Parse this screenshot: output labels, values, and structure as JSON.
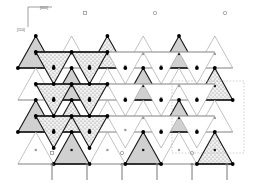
{
  "figure": {
    "name": "tetrahedral-framework-projection",
    "background": "#ffffff"
  },
  "axes": {
    "origin": [
      28,
      27
    ],
    "horizontal": {
      "label": "[001]",
      "length": 24,
      "label_pos": [
        40,
        9
      ]
    },
    "vertical": {
      "label": "[110]",
      "length": 20,
      "label_pos": [
        17,
        31
      ]
    },
    "color": "#777777"
  },
  "colors": {
    "edge_dark": "#1a1a1a",
    "edge_light": "#999999",
    "fill_gray": "#d0d0d0",
    "fill_stipple": "#e8e8e8",
    "fill_white": "#ffffff",
    "vertex": "#000000",
    "marker": "#9a9a9a",
    "arrow": "#777777",
    "cell_box": "#bbbbbb"
  },
  "lattice": {
    "x_start": 18,
    "x_step": 35.8,
    "columns": 7,
    "y_rows": [
      36,
      68,
      100,
      132
    ],
    "tri_half_width": 17.9,
    "tri_height": 32,
    "note": "alternating up/down triangles forming a corner-sharing tetrahedral net"
  },
  "triangles": [
    {
      "cx": 35.8,
      "cy": 52,
      "dir": "up",
      "fill": "gray",
      "edge": "dark"
    },
    {
      "cx": 71.6,
      "cy": 52,
      "dir": "up",
      "fill": "white",
      "edge": "light"
    },
    {
      "cx": 107.4,
      "cy": 52,
      "dir": "up",
      "fill": "stipple",
      "edge": "dark"
    },
    {
      "cx": 143.2,
      "cy": 52,
      "dir": "up",
      "fill": "white",
      "edge": "light"
    },
    {
      "cx": 179.0,
      "cy": 52,
      "dir": "up",
      "fill": "gray",
      "edge": "dark"
    },
    {
      "cx": 214.8,
      "cy": 52,
      "dir": "up",
      "fill": "white",
      "edge": "light"
    },
    {
      "cx": 53.7,
      "cy": 68,
      "dir": "down",
      "fill": "stipple",
      "edge": "dark"
    },
    {
      "cx": 89.5,
      "cy": 68,
      "dir": "down",
      "fill": "stipple",
      "edge": "dark"
    },
    {
      "cx": 125.3,
      "cy": 68,
      "dir": "down",
      "fill": "white",
      "edge": "light"
    },
    {
      "cx": 161.1,
      "cy": 68,
      "dir": "down",
      "fill": "white",
      "edge": "light"
    },
    {
      "cx": 196.9,
      "cy": 68,
      "dir": "down",
      "fill": "white",
      "edge": "light"
    },
    {
      "cx": 35.8,
      "cy": 84,
      "dir": "up",
      "fill": "white",
      "edge": "light"
    },
    {
      "cx": 71.6,
      "cy": 84,
      "dir": "up",
      "fill": "gray",
      "edge": "dark"
    },
    {
      "cx": 107.4,
      "cy": 84,
      "dir": "up",
      "fill": "white",
      "edge": "light"
    },
    {
      "cx": 143.2,
      "cy": 84,
      "dir": "up",
      "fill": "gray",
      "edge": "dark"
    },
    {
      "cx": 179.0,
      "cy": 84,
      "dir": "up",
      "fill": "white",
      "edge": "light"
    },
    {
      "cx": 214.8,
      "cy": 84,
      "dir": "up",
      "fill": "stipple",
      "edge": "dark"
    },
    {
      "cx": 53.7,
      "cy": 100,
      "dir": "down",
      "fill": "stipple",
      "edge": "dark"
    },
    {
      "cx": 89.5,
      "cy": 100,
      "dir": "down",
      "fill": "stipple",
      "edge": "dark"
    },
    {
      "cx": 125.3,
      "cy": 100,
      "dir": "down",
      "fill": "white",
      "edge": "light"
    },
    {
      "cx": 161.1,
      "cy": 100,
      "dir": "down",
      "fill": "white",
      "edge": "light"
    },
    {
      "cx": 196.9,
      "cy": 100,
      "dir": "down",
      "fill": "white",
      "edge": "light"
    },
    {
      "cx": 35.8,
      "cy": 116,
      "dir": "up",
      "fill": "gray",
      "edge": "dark"
    },
    {
      "cx": 71.6,
      "cy": 116,
      "dir": "up",
      "fill": "stipple",
      "edge": "dark"
    },
    {
      "cx": 107.4,
      "cy": 116,
      "dir": "up",
      "fill": "white",
      "edge": "light"
    },
    {
      "cx": 143.2,
      "cy": 116,
      "dir": "up",
      "fill": "white",
      "edge": "light"
    },
    {
      "cx": 179.0,
      "cy": 116,
      "dir": "up",
      "fill": "gray",
      "edge": "dark"
    },
    {
      "cx": 214.8,
      "cy": 116,
      "dir": "up",
      "fill": "white",
      "edge": "light"
    },
    {
      "cx": 53.7,
      "cy": 132,
      "dir": "down",
      "fill": "stipple",
      "edge": "dark"
    },
    {
      "cx": 89.5,
      "cy": 132,
      "dir": "down",
      "fill": "stipple",
      "edge": "dark"
    },
    {
      "cx": 125.3,
      "cy": 132,
      "dir": "down",
      "fill": "white",
      "edge": "light"
    },
    {
      "cx": 161.1,
      "cy": 132,
      "dir": "down",
      "fill": "white",
      "edge": "light"
    },
    {
      "cx": 196.9,
      "cy": 132,
      "dir": "down",
      "fill": "white",
      "edge": "light"
    },
    {
      "cx": 35.8,
      "cy": 148,
      "dir": "up",
      "fill": "white",
      "edge": "light"
    },
    {
      "cx": 71.6,
      "cy": 148,
      "dir": "up",
      "fill": "gray",
      "edge": "dark"
    },
    {
      "cx": 107.4,
      "cy": 148,
      "dir": "up",
      "fill": "white",
      "edge": "light"
    },
    {
      "cx": 143.2,
      "cy": 148,
      "dir": "up",
      "fill": "gray",
      "edge": "dark"
    },
    {
      "cx": 179.0,
      "cy": 148,
      "dir": "up",
      "fill": "white",
      "edge": "light"
    },
    {
      "cx": 214.8,
      "cy": 148,
      "dir": "up",
      "fill": "stipple",
      "edge": "dark"
    }
  ],
  "markers_top": [
    {
      "cx": 85,
      "cy": 13,
      "shape": "square"
    },
    {
      "cx": 155,
      "cy": 13,
      "shape": "circle"
    },
    {
      "cx": 225,
      "cy": 13,
      "shape": "circle"
    }
  ],
  "markers_bottom": [
    {
      "cx": 52,
      "cy": 153,
      "shape": "square"
    },
    {
      "cx": 122,
      "cy": 153,
      "shape": "circle"
    },
    {
      "cx": 192,
      "cy": 153,
      "shape": "circle"
    }
  ],
  "unit_cell": {
    "x": 172,
    "y": 81,
    "width": 72,
    "height": 72,
    "style": "dotted"
  },
  "arrows": {
    "count": 6,
    "direction": "up",
    "y_tail": 180,
    "y_head": 163,
    "x_positions": [
      52,
      87,
      122,
      157,
      192,
      227
    ],
    "color": "#777777"
  }
}
